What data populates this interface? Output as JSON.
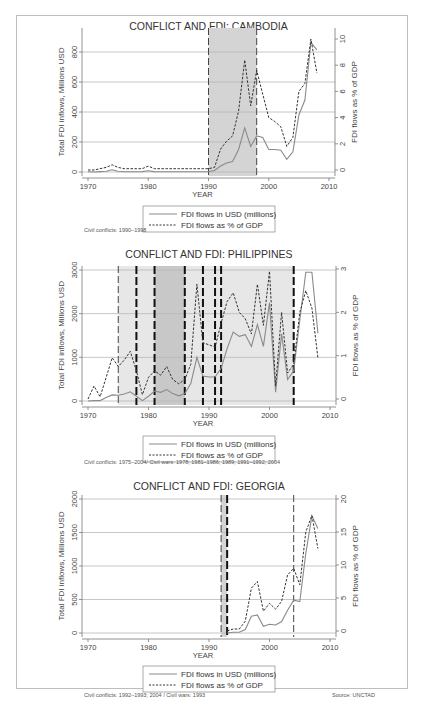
{
  "legend": {
    "usd_label": "FDI flows in USD (millions)",
    "gdp_label": "FDI flows as % of GDP"
  },
  "axes": {
    "xlabel": "YEAR",
    "ylabel_left": "Total FDI inflows, Millions USD",
    "ylabel_right": "FDI flows as % of GDP"
  },
  "source": "Source: UNCTAD",
  "colors": {
    "usd_line": "#8a8a8a",
    "gdp_line": "#333333",
    "conflict_shade": "#d4d4d4",
    "war_shade": "#bdbdbd",
    "gridline": "#b8b8b8"
  },
  "chart_data": [
    {
      "type": "line",
      "title": "CONFLICT AND FDI: CAMBODIA",
      "xlabel": "YEAR",
      "ylabel": "Total FDI inflows, Millions USD",
      "ylabel_right": "FDI flows as % of GDP",
      "xlim": [
        1970,
        2010
      ],
      "ylim": [
        0,
        900
      ],
      "ylim_right": [
        0,
        10.5
      ],
      "x_ticks": [
        1970,
        1980,
        1990,
        2000,
        2010
      ],
      "y_ticks": [
        0,
        200,
        400,
        600,
        800
      ],
      "y_ticks_right": [
        0,
        2,
        4,
        6,
        8,
        10
      ],
      "grid": true,
      "legend_position": "bottom",
      "note": "Civil conflicts: 1990–1998",
      "shaded_periods": [
        {
          "start": 1990,
          "end": 1998,
          "kind": "conflict"
        }
      ],
      "vlines": [
        {
          "x": 1990,
          "style": "dashed-thin"
        },
        {
          "x": 1998,
          "style": "dashed-thin"
        }
      ],
      "x": [
        1970,
        1971,
        1972,
        1973,
        1974,
        1975,
        1976,
        1977,
        1978,
        1979,
        1980,
        1981,
        1982,
        1983,
        1984,
        1985,
        1986,
        1987,
        1988,
        1989,
        1990,
        1991,
        1992,
        1993,
        1994,
        1995,
        1996,
        1997,
        1998,
        1999,
        2000,
        2001,
        2002,
        2003,
        2004,
        2005,
        2006,
        2007,
        2008
      ],
      "series": [
        {
          "name": "FDI flows in USD (millions)",
          "axis": "left",
          "style": "solid",
          "values": [
            2,
            0,
            3,
            5,
            15,
            5,
            2,
            2,
            2,
            3,
            8,
            3,
            2,
            2,
            2,
            2,
            2,
            2,
            2,
            2,
            2,
            10,
            40,
            60,
            70,
            150,
            295,
            170,
            240,
            230,
            150,
            150,
            145,
            85,
            135,
            380,
            480,
            865,
            815
          ]
        },
        {
          "name": "FDI flows as % of GDP",
          "axis": "right",
          "style": "dashed",
          "values": [
            0,
            0,
            0.1,
            0.2,
            0.4,
            0.2,
            0.1,
            0.1,
            0.1,
            0.1,
            0.3,
            0.1,
            0.1,
            0.1,
            0.1,
            0.1,
            0.1,
            0.1,
            0.1,
            0.1,
            0.1,
            0.2,
            1.6,
            2.2,
            2.6,
            4.5,
            8.4,
            4.9,
            7.6,
            5.8,
            4.0,
            3.7,
            3.3,
            1.8,
            2.5,
            6.0,
            6.6,
            10.0,
            7.4
          ]
        }
      ]
    },
    {
      "type": "line",
      "title": "CONFLICT AND FDI: PHILIPPINES",
      "xlabel": "YEAR",
      "ylabel": "Total FDI inflows, Millions USD",
      "ylabel_right": "FDI flows as % of GDP",
      "xlim": [
        1970,
        2010
      ],
      "ylim": [
        0,
        3000
      ],
      "ylim_right": [
        0,
        3
      ],
      "x_ticks": [
        1970,
        1980,
        1990,
        2000,
        2010
      ],
      "y_ticks": [
        0,
        1000,
        2000,
        3000
      ],
      "y_ticks_right": [
        0,
        1,
        2,
        3
      ],
      "grid": true,
      "legend_position": "bottom",
      "note": "Civil conflicts: 1975–2004/ Civil wars: 1978; 1981–1986; 1989; 1991–1992; 2004",
      "shaded_periods": [
        {
          "start": 1975,
          "end": 2004,
          "kind": "conflict"
        },
        {
          "start": 1981,
          "end": 1986,
          "kind": "war"
        }
      ],
      "vlines": [
        {
          "x": 1975,
          "style": "dashed-thin"
        },
        {
          "x": 1978,
          "style": "dashed-thick"
        },
        {
          "x": 1981,
          "style": "dashed-thick"
        },
        {
          "x": 1986,
          "style": "dashed-thick"
        },
        {
          "x": 1989,
          "style": "dashed-thick"
        },
        {
          "x": 1991,
          "style": "dashed-thick"
        },
        {
          "x": 1992,
          "style": "dashed-thick"
        },
        {
          "x": 2004,
          "style": "dashed-thick"
        }
      ],
      "x": [
        1970,
        1971,
        1972,
        1973,
        1974,
        1975,
        1976,
        1977,
        1978,
        1979,
        1980,
        1981,
        1982,
        1983,
        1984,
        1985,
        1986,
        1987,
        1988,
        1989,
        1990,
        1991,
        1992,
        1993,
        1994,
        1995,
        1996,
        1997,
        1998,
        1999,
        2000,
        2001,
        2002,
        2003,
        2004,
        2005,
        2006,
        2007,
        2008
      ],
      "series": [
        {
          "name": "FDI flows in USD (millions)",
          "axis": "left",
          "style": "solid",
          "values": [
            0,
            10,
            10,
            80,
            140,
            130,
            160,
            210,
            110,
            10,
            110,
            230,
            200,
            260,
            170,
            120,
            170,
            400,
            1000,
            570,
            550,
            550,
            750,
            1200,
            1580,
            1480,
            1520,
            1250,
            1750,
            1250,
            2250,
            200,
            1540,
            490,
            690,
            1850,
            2950,
            2950,
            1550
          ]
        },
        {
          "name": "FDI flows as % of GDP",
          "axis": "right",
          "style": "dashed",
          "values": [
            0,
            0.3,
            0.05,
            0.5,
            0.95,
            0.75,
            0.9,
            1.1,
            0.65,
            0.1,
            0.5,
            0.65,
            0.55,
            0.75,
            0.45,
            0.35,
            0.45,
            0.8,
            2.65,
            1.3,
            1.25,
            1.2,
            1.75,
            2.25,
            2.45,
            2.0,
            1.85,
            1.5,
            2.65,
            1.7,
            2.95,
            0.3,
            2.0,
            0.6,
            0.8,
            2.0,
            2.5,
            2.1,
            0.95
          ]
        }
      ]
    },
    {
      "type": "line",
      "title": "CONFLICT AND FDI: GEORGIA",
      "xlabel": "YEAR",
      "ylabel": "Total FDI inflows, Millions USD",
      "ylabel_right": "FDI flows as % of GDP",
      "xlim": [
        1970,
        2010
      ],
      "ylim": [
        0,
        2000
      ],
      "ylim_right": [
        0,
        20
      ],
      "x_ticks": [
        1970,
        1980,
        1990,
        2000,
        2010
      ],
      "y_ticks": [
        0,
        500,
        1000,
        1500,
        2000
      ],
      "y_ticks_right": [
        0,
        5,
        10,
        15,
        20
      ],
      "grid": true,
      "legend_position": "bottom",
      "note": "Civil conflicts: 1992–1993; 2004 / Civil wars: 1993",
      "shaded_periods": [
        {
          "start": 1992,
          "end": 1993,
          "kind": "conflict"
        }
      ],
      "vlines": [
        {
          "x": 1992,
          "style": "dashed-thin"
        },
        {
          "x": 1993,
          "style": "dashed-thick"
        },
        {
          "x": 2004,
          "style": "dashed-thin"
        }
      ],
      "x": [
        1993,
        1994,
        1995,
        1996,
        1997,
        1998,
        1999,
        2000,
        2001,
        2002,
        2003,
        2004,
        2005,
        2006,
        2007,
        2008
      ],
      "series": [
        {
          "name": "FDI flows in USD (millions)",
          "axis": "left",
          "style": "solid",
          "values": [
            0,
            10,
            10,
            50,
            250,
            270,
            100,
            130,
            120,
            170,
            340,
            490,
            470,
            1190,
            1750,
            1560
          ]
        },
        {
          "name": "FDI flows as % of GDP",
          "axis": "right",
          "style": "dashed",
          "values": [
            0,
            0.3,
            0.3,
            1.5,
            6.5,
            7.5,
            3.0,
            4.2,
            3.3,
            4.5,
            8.5,
            9.5,
            7.0,
            15.0,
            17.5,
            12.5
          ]
        }
      ]
    }
  ]
}
